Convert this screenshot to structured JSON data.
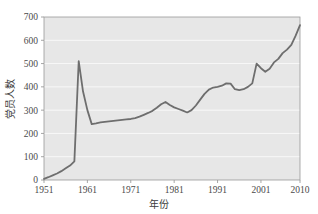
{
  "chart_data": {
    "type": "line",
    "title": "",
    "xlabel": "年份",
    "ylabel": "党员人数",
    "xlim": [
      1951,
      2010
    ],
    "ylim": [
      0,
      700
    ],
    "grid": true,
    "legend": false,
    "legend_position": "none",
    "line_color": "#6e6e6e",
    "plot_background_color": "#e7e7e7",
    "gridline_color": "#fbfbfb",
    "xticks": [
      "1951",
      "1961",
      "1971",
      "1981",
      "1991",
      "2001",
      "2010"
    ],
    "xtick_values": [
      1951,
      1961,
      1971,
      1981,
      1991,
      2001,
      2010
    ],
    "yticks": [
      "0",
      "100",
      "200",
      "300",
      "400",
      "500",
      "600",
      "700"
    ],
    "ytick_values": [
      0,
      100,
      200,
      300,
      400,
      500,
      600,
      700
    ],
    "series": [
      {
        "name": "党员人数",
        "x": [
          1951,
          1952,
          1953,
          1954,
          1955,
          1956,
          1957,
          1958,
          1959,
          1960,
          1961,
          1962,
          1963,
          1964,
          1965,
          1966,
          1967,
          1968,
          1969,
          1970,
          1971,
          1972,
          1973,
          1974,
          1975,
          1976,
          1977,
          1978,
          1979,
          1980,
          1981,
          1982,
          1983,
          1984,
          1985,
          1986,
          1987,
          1988,
          1989,
          1990,
          1991,
          1992,
          1993,
          1994,
          1995,
          1996,
          1997,
          1998,
          1999,
          2000,
          2001,
          2002,
          2003,
          2004,
          2005,
          2006,
          2007,
          2008,
          2009,
          2010
        ],
        "values": [
          5,
          12,
          20,
          28,
          38,
          50,
          62,
          80,
          510,
          380,
          300,
          240,
          243,
          247,
          250,
          252,
          254,
          256,
          258,
          260,
          262,
          266,
          272,
          280,
          288,
          297,
          310,
          325,
          335,
          322,
          312,
          305,
          298,
          290,
          300,
          320,
          345,
          370,
          388,
          397,
          400,
          405,
          415,
          414,
          390,
          386,
          390,
          400,
          415,
          500,
          480,
          465,
          478,
          505,
          520,
          545,
          560,
          580,
          620,
          665
        ]
      }
    ]
  }
}
